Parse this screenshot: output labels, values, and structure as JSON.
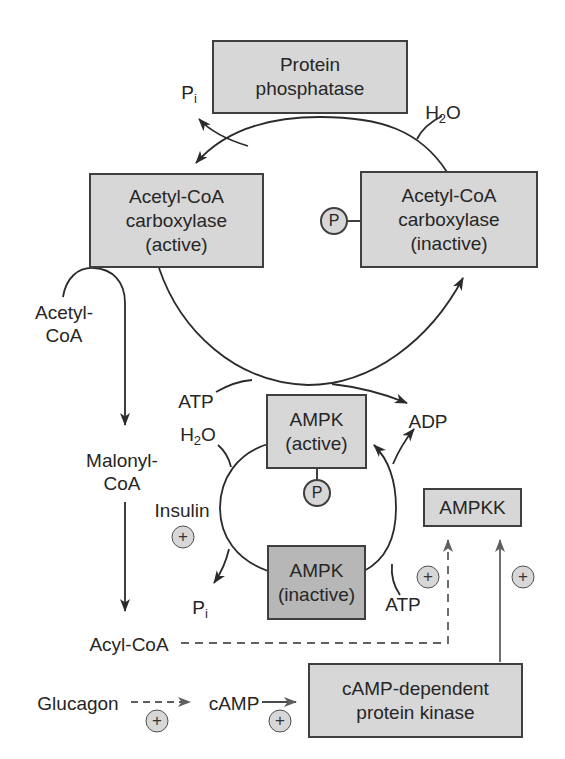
{
  "boxes": {
    "protein_phosphatase": {
      "line1": "Protein",
      "line2": "phosphatase"
    },
    "acc_active": {
      "line1": "Acetyl-CoA",
      "line2": "carboxylase",
      "line3": "(active)"
    },
    "acc_inactive": {
      "line1": "Acetyl-CoA",
      "line2": "carboxylase",
      "line3": "(inactive)"
    },
    "ampk_active": {
      "line1": "AMPK",
      "line2": "(active)"
    },
    "ampk_inactive": {
      "line1": "AMPK",
      "line2": "(inactive)"
    },
    "ampkk": {
      "line1": "AMPKK"
    },
    "camp_pk": {
      "line1": "cAMP-dependent",
      "line2": "protein kinase"
    }
  },
  "labels": {
    "pi_top": {
      "base": "P",
      "sub": "i"
    },
    "h2o_top": {
      "base": "H",
      "sub": "2",
      "post": "O"
    },
    "acetyl_coa": {
      "line1": "Acetyl-",
      "line2": "CoA"
    },
    "malonyl_coa": {
      "line1": "Malonyl-",
      "line2": "CoA"
    },
    "atp_cycle": "ATP",
    "adp_cycle": "ADP",
    "h2o_ampk": {
      "base": "H",
      "sub": "2",
      "post": "O"
    },
    "pi_ampk": {
      "base": "P",
      "sub": "i"
    },
    "insulin": "Insulin",
    "atp_ampk": "ATP",
    "acyl_coa": "Acyl-CoA",
    "glucagon": "Glucagon",
    "camp": "cAMP"
  },
  "markers": {
    "phosphate": "P",
    "plus": "+"
  },
  "colors": {
    "background": "#ffffff",
    "box_fill": "#d7d7d7",
    "box_fill_inactive": "#b7b7b7",
    "box_border": "#3f3f3f",
    "line_dark": "#2b2b2b",
    "line_gray": "#5f5f5f",
    "text": "#262626"
  }
}
